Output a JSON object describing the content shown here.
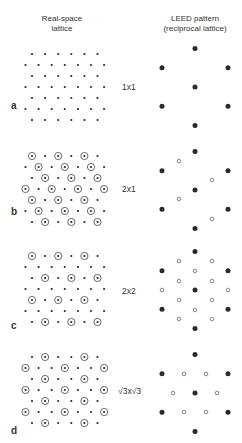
{
  "headers": {
    "real_space_line1": "Real-space",
    "real_space_line2": "lattice",
    "leed_line1": "LEED pattern",
    "leed_line2": "(reciprocal lattice)"
  },
  "panels": [
    {
      "letter": "a",
      "label": "1x1",
      "letter_y": 100,
      "label_y": 84
    },
    {
      "letter": "b",
      "label": "2x1",
      "letter_y": 207,
      "label_y": 186
    },
    {
      "letter": "c",
      "label": "2x2",
      "letter_y": 322,
      "label_y": 287
    },
    {
      "letter": "d",
      "label": "√3x√3",
      "letter_y": 427,
      "label_y": 387
    }
  ],
  "colors": {
    "dot": "#2a2a2a",
    "ring": "#444444",
    "open_spot": "#555555"
  }
}
